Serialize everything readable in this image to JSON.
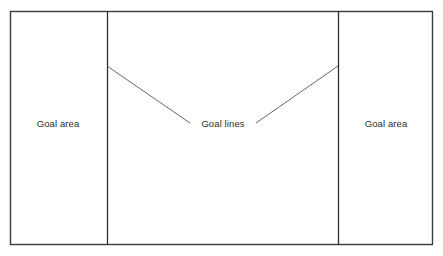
{
  "diagram": {
    "colors": {
      "outer_border": "#3a3a3a",
      "divider_line": "#2f2f2f",
      "leader_line": "#555555",
      "text": "#2b2b2b",
      "background": "#ffffff"
    },
    "field": {
      "name": "field-rectangle",
      "x": 10,
      "y": 11,
      "width": 423,
      "height": 234
    },
    "goal_lines": [
      {
        "name": "goal-line-left",
        "x": 107,
        "y1": 11,
        "y2": 245
      },
      {
        "name": "goal-line-right",
        "x": 338,
        "y1": 11,
        "y2": 245
      }
    ],
    "leader_lines": [
      {
        "name": "leader-line-left",
        "x1": 107,
        "y1": 66,
        "x2": 190,
        "y2": 123
      },
      {
        "name": "leader-line-right",
        "x1": 256,
        "y1": 123,
        "x2": 338,
        "y2": 66
      }
    ],
    "labels": {
      "goal_area_left": "Goal area",
      "goal_lines": "Goal lines",
      "goal_area_right": "Goal area"
    }
  }
}
